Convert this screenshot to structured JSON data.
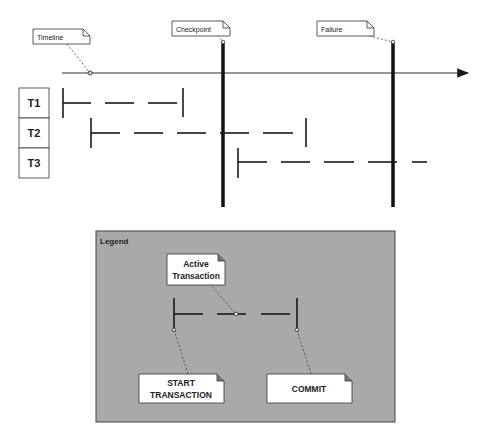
{
  "diagram": {
    "timeline": {
      "label": "Timeline"
    },
    "events": [
      {
        "label": "Checkpoint",
        "x": 223
      },
      {
        "label": "Failure",
        "x": 393
      }
    ],
    "transactions": [
      {
        "label": "T1",
        "start_x": 63,
        "commit_x": 183,
        "committed": true
      },
      {
        "label": "T2",
        "start_x": 91,
        "commit_x": 306,
        "committed": true
      },
      {
        "label": "T3",
        "start_x": 238,
        "commit_x": null,
        "committed": false
      }
    ]
  },
  "legend": {
    "title": "Legend",
    "active_transaction": {
      "line1": "Active",
      "line2": "Transaction"
    },
    "start_transaction": {
      "line1": "START",
      "line2": "TRANSACTION"
    },
    "commit": {
      "label": "COMMIT"
    }
  },
  "colors": {
    "line": "#1a1a1a",
    "legend_bg": "#a9a9a9",
    "note_bg": "#ffffff",
    "leader": "#444444"
  }
}
